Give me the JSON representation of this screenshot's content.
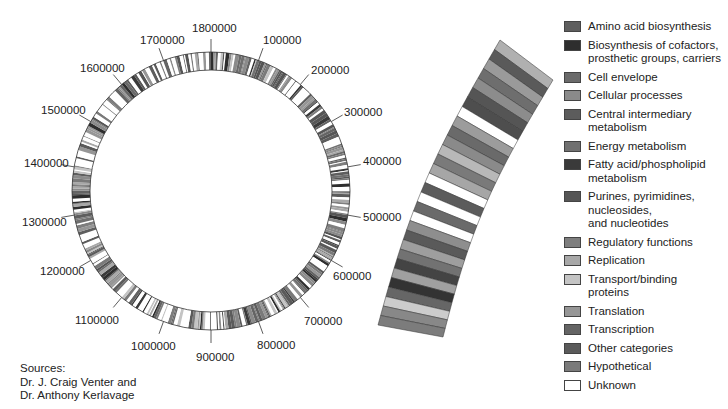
{
  "ring": {
    "cx": 211,
    "cy": 191,
    "r_outer": 139,
    "r_inner": 121,
    "tick_labels": [
      {
        "text": "1800000",
        "x": 192,
        "y": 23
      },
      {
        "text": "100000",
        "x": 263,
        "y": 35
      },
      {
        "text": "200000",
        "x": 311,
        "y": 65
      },
      {
        "text": "300000",
        "x": 344,
        "y": 107
      },
      {
        "text": "400000",
        "x": 363,
        "y": 156
      },
      {
        "text": "500000",
        "x": 363,
        "y": 212
      },
      {
        "text": "600000",
        "x": 333,
        "y": 271
      },
      {
        "text": "700000",
        "x": 304,
        "y": 316
      },
      {
        "text": "800000",
        "x": 257,
        "y": 340
      },
      {
        "text": "900000",
        "x": 196,
        "y": 352
      },
      {
        "text": "1000000",
        "x": 131,
        "y": 341
      },
      {
        "text": "1100000",
        "x": 75,
        "y": 315
      },
      {
        "text": "1200000",
        "x": 40,
        "y": 266
      },
      {
        "text": "1300000",
        "x": 22,
        "y": 217
      },
      {
        "text": "1400000",
        "x": 24,
        "y": 158
      },
      {
        "text": "1500000",
        "x": 41,
        "y": 105
      },
      {
        "text": "1600000",
        "x": 80,
        "y": 63
      },
      {
        "text": "1700000",
        "x": 140,
        "y": 35
      }
    ]
  },
  "wedge_bands": [
    "#b0b0b0",
    "#5a5a5a",
    "#9a9a9a",
    "#6e6e6e",
    "#8c8c8c",
    "#555",
    "#4e4e4e",
    "#ffffff",
    "#9c9c9c",
    "#6a6a6a",
    "#8a8a8a",
    "#b8b8b8",
    "#7a7a7a",
    "#a6a6a6",
    "#ffffff",
    "#5c5c5c",
    "#ffffff",
    "#6a6a6a",
    "#ffffff",
    "#8e8e8e",
    "#5a5a5a",
    "#9e9e9e",
    "#727272",
    "#444",
    "#a0a0a0",
    "#333",
    "#666",
    "#ccc",
    "#888",
    "#7c7c7c"
  ],
  "legend": {
    "items": [
      {
        "label": "Amino acid biosynthesis",
        "color": "#5e5e5e"
      },
      {
        "label": "Biosynthesis of cofactors,\nprosthetic groups, carriers",
        "color": "#2e2e2e"
      },
      {
        "label": "Cell envelope",
        "color": "#6a6a6a"
      },
      {
        "label": "Cellular processes",
        "color": "#8a8a8a"
      },
      {
        "label": "Central intermediary\nmetabolism",
        "color": "#5c5c5c"
      },
      {
        "label": "Energy metabolism",
        "color": "#707070"
      },
      {
        "label": "Fatty acid/phospholipid\nmetabolism",
        "color": "#3a3a3a"
      },
      {
        "label": "Purines, pyrimidines,\nnucleosides,\nand nucleotides",
        "color": "#555555"
      },
      {
        "label": "Regulatory functions",
        "color": "#7e7e7e"
      },
      {
        "label": "Replication",
        "color": "#a8a8a8"
      },
      {
        "label": "Transport/binding\nproteins",
        "color": "#c4c4c4"
      },
      {
        "label": "Translation",
        "color": "#969696"
      },
      {
        "label": "Transcription",
        "color": "#646464"
      },
      {
        "label": "Other categories",
        "color": "#5a5a5a"
      },
      {
        "label": "Hypothetical",
        "color": "#7a7a7a"
      },
      {
        "label": "Unknown",
        "color": "#ffffff"
      }
    ]
  },
  "sources": {
    "line1": "Sources:",
    "line2": "Dr. J. Craig Venter  and",
    "line3": "Dr. Anthony Kerlavage"
  }
}
